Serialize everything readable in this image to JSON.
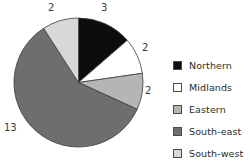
{
  "chart_data": {
    "type": "pie",
    "title": "",
    "categories": [
      "Northern",
      "Midlands",
      "Eastern",
      "South-east",
      "South-west"
    ],
    "values": [
      3,
      2,
      2,
      13,
      2
    ],
    "total": 22,
    "colors": [
      "#0d0d0d",
      "#ffffff",
      "#b5b5b5",
      "#6e6e6e",
      "#d8d8d8"
    ],
    "start_angle_deg": 0,
    "direction": "clockwise",
    "data_labels": [
      "3",
      "2",
      "2",
      "13",
      "2"
    ],
    "legend_position": "right",
    "grid": false,
    "xlabel": "",
    "ylabel": ""
  },
  "labels": {
    "northern_value": "3",
    "midlands_value": "2",
    "eastern_value": "2",
    "southeast_value": "13",
    "southwest_value": "2"
  },
  "legend": {
    "items": [
      {
        "label": "Northern",
        "color": "#0d0d0d"
      },
      {
        "label": "Midlands",
        "color": "#ffffff"
      },
      {
        "label": "Eastern",
        "color": "#b5b5b5"
      },
      {
        "label": "South-east",
        "color": "#6e6e6e"
      },
      {
        "label": "South-west",
        "color": "#d8d8d8"
      }
    ]
  }
}
